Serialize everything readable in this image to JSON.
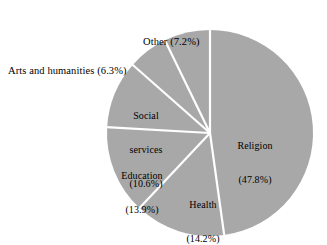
{
  "chart_data": {
    "type": "pie",
    "title": "",
    "subtitle": "",
    "xlabel": "",
    "ylabel": "",
    "legend": "none",
    "grid": false,
    "units": "percent",
    "start_angle_deg": 0,
    "direction": "clockwise",
    "categories": [
      "Religion",
      "Health",
      "Education",
      "Social services",
      "Arts and humanities",
      "Other"
    ],
    "values": [
      47.8,
      14.2,
      13.9,
      10.6,
      6.3,
      7.2
    ],
    "slice_color": "#a8a8a8",
    "separator_color": "#ffffff",
    "slices": [
      {
        "name": "Religion",
        "label_lines": [
          "Religion",
          "(47.8%)"
        ],
        "value": 47.8,
        "percent_text": "(47.8%)",
        "label_placement": "inside"
      },
      {
        "name": "Health",
        "label_lines": [
          "Health",
          "(14.2%)"
        ],
        "value": 14.2,
        "percent_text": "(14.2%)",
        "label_placement": "inside"
      },
      {
        "name": "Education",
        "label_lines": [
          "Education",
          "(13.9%)"
        ],
        "value": 13.9,
        "percent_text": "(13.9%)",
        "label_placement": "inside"
      },
      {
        "name": "Social services",
        "label_lines": [
          "Social",
          "services",
          "(10.6%)"
        ],
        "value": 10.6,
        "percent_text": "(10.6%)",
        "label_placement": "inside"
      },
      {
        "name": "Arts and humanities",
        "label_lines": [
          "Arts and humanities (6.3%)"
        ],
        "value": 6.3,
        "percent_text": "(6.3%)",
        "label_placement": "outside"
      },
      {
        "name": "Other",
        "label_lines": [
          "Other (7.2%)"
        ],
        "value": 7.2,
        "percent_text": "(7.2%)",
        "label_placement": "outside"
      }
    ],
    "geometry": {
      "center_x": 210,
      "center_y": 133,
      "radius": 103,
      "separator_width": 2.2
    }
  },
  "labels": {
    "other": "Other (7.2%)",
    "arts": "Arts and humanities (6.3%)",
    "social_l1": "Social",
    "social_l2": "services",
    "social_l3": "(10.6%)",
    "education_l1": "Education",
    "education_l2": "(13.9%)",
    "health_l1": "Health",
    "health_l2": "(14.2%)",
    "religion_l1": "Religion",
    "religion_l2": "(47.8%)"
  }
}
